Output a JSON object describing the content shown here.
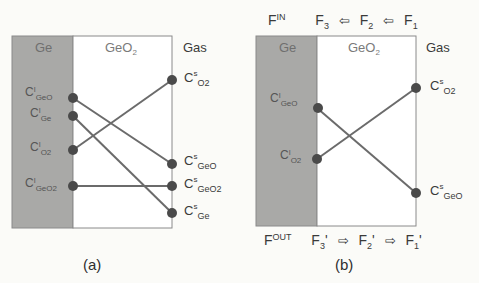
{
  "panels": {
    "a": {
      "caption": "(a)",
      "regions": {
        "ge": "Ge",
        "oxide_base": "GeO",
        "oxide_sub": "2",
        "gas": "Gas"
      },
      "inner_labels": [
        {
          "base": "C",
          "sup": "I",
          "sub": "GeO"
        },
        {
          "base": "C",
          "sup": "I",
          "sub": "Ge"
        },
        {
          "base": "C",
          "sup": "I",
          "sub": "O2"
        },
        {
          "base": "C",
          "sup": "I",
          "sub": "GeO2"
        }
      ],
      "surface_labels": [
        {
          "base": "C",
          "sup": "s",
          "sub": "O2"
        },
        {
          "base": "C",
          "sup": "s",
          "sub": "GeO"
        },
        {
          "base": "C",
          "sup": "s",
          "sub": "GeO2"
        },
        {
          "base": "C",
          "sup": "s",
          "sub": "Ge"
        }
      ],
      "connections": [
        {
          "from": "C^I_GeO",
          "to": "C^s_GeO"
        },
        {
          "from": "C^I_Ge",
          "to": "C^s_Ge"
        },
        {
          "from": "C^I_O2",
          "to": "C^s_O2"
        },
        {
          "from": "C^I_GeO2",
          "to": "C^s_GeO2"
        }
      ]
    },
    "b": {
      "caption": "(b)",
      "regions": {
        "ge": "Ge",
        "oxide_base": "GeO",
        "oxide_sub": "2",
        "gas": "Gas"
      },
      "inner_labels": [
        {
          "base": "C",
          "sup": "I",
          "sub": "GeO"
        },
        {
          "base": "C",
          "sup": "I",
          "sub": "O2"
        }
      ],
      "surface_labels": [
        {
          "base": "C",
          "sup": "s",
          "sub": "O2"
        },
        {
          "base": "C",
          "sup": "s",
          "sub": "GeO"
        }
      ],
      "connections": [
        {
          "from": "C^I_GeO",
          "to": "C^s_GeO"
        },
        {
          "from": "C^I_O2",
          "to": "C^s_O2"
        }
      ],
      "flux_in": {
        "label_base": "F",
        "label_sup": "IN",
        "terms": [
          {
            "base": "F",
            "sub": "3",
            "prime": ""
          },
          {
            "base": "F",
            "sub": "2",
            "prime": ""
          },
          {
            "base": "F",
            "sub": "1",
            "prime": ""
          }
        ],
        "arrow": "⇦"
      },
      "flux_out": {
        "label_base": "F",
        "label_sup": "OUT",
        "terms": [
          {
            "base": "F",
            "sub": "3",
            "prime": "'"
          },
          {
            "base": "F",
            "sub": "2",
            "prime": "'"
          },
          {
            "base": "F",
            "sub": "1",
            "prime": "'"
          }
        ],
        "arrow": "⇨"
      }
    }
  },
  "colors": {
    "ge_fill": "#a9a9a7",
    "oxide_fill": "#ffffff",
    "line": "#6b6b6b",
    "dot": "#4a4a4a",
    "border": "#8a8a8a"
  }
}
